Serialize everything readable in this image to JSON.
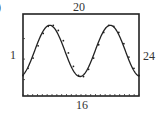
{
  "figure": {
    "part_label": ")",
    "window_labels": {
      "top": "20",
      "bottom": "16",
      "left": "1",
      "right": "24"
    }
  },
  "chart_data": {
    "type": "scatter",
    "title": "",
    "xlabel": "",
    "ylabel": "",
    "xlim": [
      1,
      24
    ],
    "ylim": [
      16,
      20
    ],
    "grid": false,
    "legend": null,
    "x_tick_count": 24,
    "series": [
      {
        "name": "data points",
        "kind": "scatter",
        "x": [
          1,
          2,
          3,
          4,
          5,
          6,
          7,
          8,
          9,
          10,
          11,
          12,
          13,
          14,
          15,
          16,
          17,
          18,
          19,
          20,
          21,
          22,
          23,
          24
        ],
        "y": [
          17.0,
          17.35,
          17.85,
          18.45,
          19.05,
          19.4,
          19.45,
          19.2,
          18.7,
          18.1,
          17.45,
          17.0,
          16.95,
          17.3,
          17.85,
          18.5,
          19.1,
          19.45,
          19.4,
          19.1,
          18.55,
          17.9,
          17.35,
          17.0
        ]
      },
      {
        "name": "sine model",
        "kind": "line",
        "amplitude": 1.25,
        "period": 12,
        "phase_peak_x": 6.3,
        "midline": 18.2
      }
    ]
  }
}
